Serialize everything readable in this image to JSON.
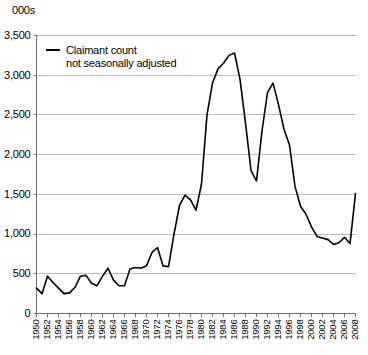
{
  "chart_data": {
    "type": "line",
    "title": "",
    "subtitle": "",
    "unit_label": "000s",
    "xlabel": "",
    "ylabel": "",
    "ylim": [
      0,
      3500
    ],
    "xlim": [
      1950,
      2008
    ],
    "yticks": [
      0,
      500,
      1000,
      1500,
      2000,
      2500,
      3000,
      3500
    ],
    "ytick_labels": [
      "0",
      "500",
      "1,000",
      "1,500",
      "2,000",
      "2,500",
      "3,000",
      "3,500"
    ],
    "xtick_labels": [
      "1950",
      "1952",
      "1954",
      "1956",
      "1958",
      "1960",
      "1962",
      "1964",
      "1966",
      "1968",
      "1970",
      "1972",
      "1974",
      "1976",
      "1978",
      "1980",
      "1982",
      "1984",
      "1986",
      "1988",
      "1990",
      "1992",
      "1994",
      "1996",
      "1998",
      "2000",
      "2002",
      "2004",
      "2006",
      "2008"
    ],
    "grid": true,
    "legend_position": "top-left",
    "legend": [
      {
        "label_line1": "Claimant count",
        "label_line2": "not seasonally adjusted",
        "color": "#000000"
      }
    ],
    "series": [
      {
        "name": "Claimant count not seasonally adjusted",
        "color": "#000000",
        "x": [
          1950,
          1951,
          1952,
          1953,
          1954,
          1955,
          1956,
          1957,
          1958,
          1959,
          1960,
          1961,
          1962,
          1963,
          1964,
          1965,
          1966,
          1967,
          1968,
          1969,
          1970,
          1971,
          1972,
          1973,
          1974,
          1975,
          1976,
          1977,
          1978,
          1979,
          1980,
          1981,
          1982,
          1983,
          1984,
          1985,
          1986,
          1987,
          1988,
          1989,
          1990,
          1991,
          1992,
          1993,
          1994,
          1995,
          1996,
          1997,
          1998,
          1999,
          2000,
          2001,
          2002,
          2003,
          2004,
          2005,
          2006,
          2007,
          2008
        ],
        "values": [
          320,
          250,
          470,
          390,
          320,
          250,
          260,
          330,
          470,
          480,
          380,
          350,
          470,
          570,
          420,
          350,
          350,
          560,
          580,
          570,
          600,
          770,
          830,
          600,
          590,
          1000,
          1360,
          1490,
          1430,
          1300,
          1630,
          2500,
          2900,
          3080,
          3150,
          3250,
          3280,
          2950,
          2400,
          1800,
          1670,
          2300,
          2780,
          2900,
          2630,
          2320,
          2120,
          1600,
          1350,
          1250,
          1090,
          970,
          950,
          930,
          870,
          890,
          960,
          880,
          1510
        ]
      }
    ]
  }
}
